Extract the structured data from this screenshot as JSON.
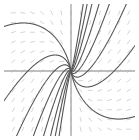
{
  "figure": {
    "width": 139,
    "height": 140,
    "background_color": "#ffffff",
    "title": "",
    "caption": ""
  },
  "chart_data": {
    "type": "line",
    "subtype": "slope-field-with-trajectories",
    "title": "",
    "subtitle": "",
    "xlabel": "",
    "ylabel": "",
    "xlim": [
      -6.5,
      6.5
    ],
    "ylim": [
      -6.5,
      6.5
    ],
    "grid": false,
    "legend": "none",
    "tick_labels_x": [],
    "tick_labels_y": [],
    "annotations": [],
    "axes": {
      "show_x_axis": true,
      "show_y_axis": true,
      "x_axis_y_value": 0,
      "y_axis_x_value": 0,
      "axis_color": "#aaaaaa",
      "axis_width": 1.4
    },
    "critical_point": {
      "label": "node",
      "x": 0,
      "y": 0,
      "pixel_x": 71,
      "pixel_y": 71
    },
    "field": {
      "description": "direction field dash marks on a regular lattice",
      "color": "#c9c9c9",
      "dash_length": 5,
      "grid_nx": 13,
      "grid_ny": 13,
      "x_values": [
        -6,
        -5,
        -4,
        -3,
        -2,
        -1,
        0,
        1,
        2,
        3,
        4,
        5,
        6
      ],
      "y_values": [
        -6,
        -5,
        -4,
        -3,
        -2,
        -1,
        0,
        1,
        2,
        3,
        4,
        5,
        6
      ]
    },
    "curve_color": "#555555",
    "curve_width": 1.1,
    "series": [
      {
        "name": "trajectory-q1-a",
        "slope_param": 0.18,
        "quadrant": 1,
        "shape": "ray"
      },
      {
        "name": "trajectory-q1-b",
        "slope_param": 0.45,
        "quadrant": 1,
        "shape": "ray"
      },
      {
        "name": "trajectory-q1-c",
        "slope_param": 0.85,
        "quadrant": 1,
        "shape": "ray"
      },
      {
        "name": "trajectory-q1-d",
        "slope_param": 1.55,
        "quadrant": 1,
        "shape": "ray"
      },
      {
        "name": "trajectory-q3-a",
        "slope_param": 0.18,
        "quadrant": 3,
        "shape": "ray"
      },
      {
        "name": "trajectory-q3-b",
        "slope_param": 0.45,
        "quadrant": 3,
        "shape": "ray"
      },
      {
        "name": "trajectory-q3-c",
        "slope_param": 0.85,
        "quadrant": 3,
        "shape": "ray"
      },
      {
        "name": "trajectory-q3-d",
        "slope_param": 1.55,
        "quadrant": 3,
        "shape": "ray"
      },
      {
        "name": "trajectory-q2-a",
        "curvature": 0.3,
        "quadrant": 2,
        "shape": "bent"
      },
      {
        "name": "trajectory-q2-b",
        "curvature": 0.55,
        "quadrant": 2,
        "shape": "bent"
      },
      {
        "name": "trajectory-q2-c",
        "curvature": 0.95,
        "quadrant": 2,
        "shape": "bent"
      },
      {
        "name": "trajectory-q2-d",
        "curvature": 1.6,
        "quadrant": 2,
        "shape": "bent"
      },
      {
        "name": "trajectory-q4-a",
        "curvature": 0.3,
        "quadrant": 4,
        "shape": "bent"
      },
      {
        "name": "trajectory-q4-b",
        "curvature": 0.55,
        "quadrant": 4,
        "shape": "bent"
      },
      {
        "name": "trajectory-q4-c",
        "curvature": 0.95,
        "quadrant": 4,
        "shape": "bent"
      },
      {
        "name": "trajectory-q4-d",
        "curvature": 1.6,
        "quadrant": 4,
        "shape": "bent"
      }
    ]
  }
}
